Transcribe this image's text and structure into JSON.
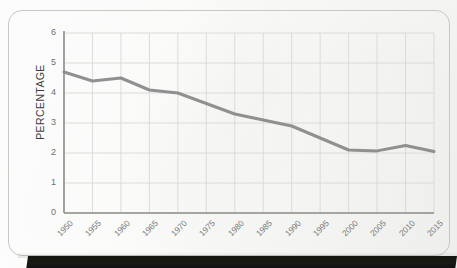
{
  "chart_data": {
    "type": "line",
    "title": "",
    "xlabel": "",
    "ylabel": "PERCENTAGE",
    "categories": [
      "1950",
      "1955",
      "1960",
      "1965",
      "1970",
      "1975",
      "1980",
      "1985",
      "1990",
      "1995",
      "2000",
      "2005",
      "2010",
      "2015"
    ],
    "x": [
      1950,
      1955,
      1960,
      1965,
      1970,
      1975,
      1980,
      1985,
      1990,
      1995,
      2000,
      2005,
      2010,
      2015
    ],
    "values": [
      4.7,
      4.4,
      4.5,
      4.1,
      4.0,
      3.65,
      3.3,
      3.1,
      2.9,
      2.5,
      2.1,
      2.07,
      2.25,
      2.05
    ],
    "series": [
      {
        "name": "Percentage",
        "color": "#8a8a8a",
        "values": [
          4.7,
          4.4,
          4.5,
          4.1,
          4.0,
          3.65,
          3.3,
          3.1,
          2.9,
          2.5,
          2.1,
          2.07,
          2.25,
          2.05
        ]
      }
    ],
    "ylim": [
      0,
      6
    ],
    "ytick_labels": [
      "0",
      "1",
      "2",
      "3",
      "4",
      "5",
      "6"
    ],
    "yticks": [
      0,
      1,
      2,
      3,
      4,
      5,
      6
    ],
    "xlim": [
      1950,
      2015
    ],
    "grid": true,
    "grid_color": "#d8d8d6",
    "legend": false,
    "legend_position": "none",
    "axis_color": "#8e8e8c",
    "line_width": 3,
    "annotations": []
  },
  "figure": {
    "card_border_color": "#c7c7c4",
    "background_color": "#fbfbfa",
    "band_color": "#15150f"
  },
  "ytitle": "PERCENTAGE"
}
